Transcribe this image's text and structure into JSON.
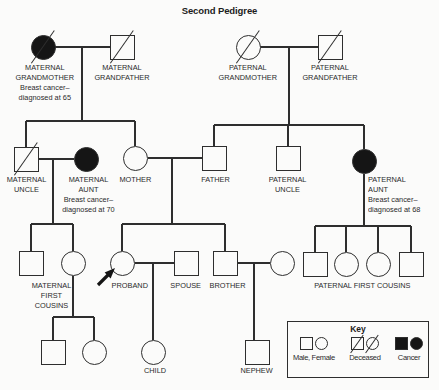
{
  "title": "Second Pedigree",
  "colors": {
    "line": "#2e2e2e",
    "symbol_fill": "#151515",
    "background": "#fbfbfa",
    "text": "#2a2a2a"
  },
  "pedigree": {
    "nodes": [
      {
        "id": "maternal-grandmother",
        "shape": "circle",
        "filled": true,
        "deceased": true,
        "x": 43,
        "y": 47
      },
      {
        "id": "maternal-grandfather",
        "shape": "square",
        "filled": false,
        "deceased": true,
        "x": 122,
        "y": 47
      },
      {
        "id": "paternal-grandmother",
        "shape": "circle",
        "filled": false,
        "deceased": true,
        "x": 248,
        "y": 47
      },
      {
        "id": "paternal-grandfather",
        "shape": "square",
        "filled": false,
        "deceased": true,
        "x": 330,
        "y": 47
      },
      {
        "id": "maternal-uncle",
        "shape": "square",
        "filled": false,
        "deceased": true,
        "x": 26,
        "y": 159
      },
      {
        "id": "maternal-aunt",
        "shape": "circle",
        "filled": true,
        "deceased": false,
        "x": 86,
        "y": 159
      },
      {
        "id": "mother",
        "shape": "circle",
        "filled": false,
        "deceased": false,
        "x": 135,
        "y": 158
      },
      {
        "id": "father",
        "shape": "square",
        "filled": false,
        "deceased": false,
        "x": 214,
        "y": 158
      },
      {
        "id": "paternal-uncle",
        "shape": "square",
        "filled": false,
        "deceased": false,
        "x": 288,
        "y": 158
      },
      {
        "id": "paternal-aunt",
        "shape": "circle",
        "filled": true,
        "deceased": false,
        "x": 364,
        "y": 161
      },
      {
        "id": "maternal-first-cousin-male",
        "shape": "square",
        "filled": false,
        "deceased": false,
        "x": 31,
        "y": 263
      },
      {
        "id": "maternal-first-cousin-female",
        "shape": "circle",
        "filled": false,
        "deceased": false,
        "x": 73,
        "y": 263
      },
      {
        "id": "proband",
        "shape": "circle",
        "filled": false,
        "deceased": false,
        "x": 122,
        "y": 263,
        "proband": true
      },
      {
        "id": "spouse",
        "shape": "square",
        "filled": false,
        "deceased": false,
        "x": 186,
        "y": 263
      },
      {
        "id": "brother",
        "shape": "square",
        "filled": false,
        "deceased": false,
        "x": 225,
        "y": 263
      },
      {
        "id": "brothers-wife",
        "shape": "circle",
        "filled": false,
        "deceased": false,
        "x": 282,
        "y": 263
      },
      {
        "id": "paternal-first-cousin-1",
        "shape": "square",
        "filled": false,
        "deceased": false,
        "x": 315,
        "y": 264
      },
      {
        "id": "paternal-first-cousin-2",
        "shape": "circle",
        "filled": false,
        "deceased": false,
        "x": 346,
        "y": 264
      },
      {
        "id": "paternal-first-cousin-3",
        "shape": "circle",
        "filled": false,
        "deceased": false,
        "x": 378,
        "y": 264
      },
      {
        "id": "paternal-first-cousin-4",
        "shape": "square",
        "filled": false,
        "deceased": false,
        "x": 411,
        "y": 264
      },
      {
        "id": "cousins-child-male",
        "shape": "square",
        "filled": false,
        "deceased": false,
        "x": 53,
        "y": 352
      },
      {
        "id": "cousins-child-female",
        "shape": "circle",
        "filled": false,
        "deceased": false,
        "x": 94,
        "y": 352
      },
      {
        "id": "child",
        "shape": "circle",
        "filled": false,
        "deceased": false,
        "x": 153,
        "y": 352
      },
      {
        "id": "nephew",
        "shape": "square",
        "filled": false,
        "deceased": false,
        "x": 257,
        "y": 352
      }
    ],
    "labels": [
      {
        "id": "maternal-grandmother",
        "x": 45,
        "y": 63,
        "align": "center",
        "lines": [
          "MATERNAL",
          "GRANDMOTHER",
          "Breast cancer–",
          "diagnosed at 65"
        ]
      },
      {
        "id": "maternal-grandfather",
        "x": 122,
        "y": 63,
        "align": "center",
        "lines": [
          "MATERNAL",
          "GRANDFATHER"
        ]
      },
      {
        "id": "paternal-grandmother",
        "x": 248,
        "y": 63,
        "align": "center",
        "lines": [
          "PATERNAL",
          "GRANDMOTHER"
        ]
      },
      {
        "id": "paternal-grandfather",
        "x": 330,
        "y": 63,
        "align": "center",
        "lines": [
          "PATERNAL",
          "GRANDFATHER"
        ]
      },
      {
        "id": "maternal-uncle",
        "x": 26,
        "y": 175,
        "align": "center",
        "lines": [
          "MATERNAL",
          "UNCLE"
        ]
      },
      {
        "id": "maternal-aunt",
        "x": 88,
        "y": 175,
        "align": "center",
        "lines": [
          "MATERNAL",
          "AUNT",
          "Breast cancer–",
          "diagnosed at 70"
        ]
      },
      {
        "id": "mother",
        "x": 135,
        "y": 175,
        "align": "center",
        "lines": [
          "MOTHER"
        ]
      },
      {
        "id": "father",
        "x": 215,
        "y": 175,
        "align": "center",
        "lines": [
          "FATHER"
        ]
      },
      {
        "id": "paternal-uncle",
        "x": 288,
        "y": 175,
        "align": "center",
        "lines": [
          "PATERNAL",
          "UNCLE"
        ]
      },
      {
        "id": "paternal-aunt",
        "x": 368,
        "y": 175,
        "align": "left",
        "lines": [
          "PATERNAL",
          "AUNT",
          "Breast cancer–",
          "diagnosed at 68"
        ]
      },
      {
        "id": "maternal-first-cousins",
        "x": 51,
        "y": 281,
        "align": "center",
        "lines": [
          "MATERNAL",
          "FIRST",
          "COUSINS"
        ]
      },
      {
        "id": "proband",
        "x": 130,
        "y": 281,
        "align": "center",
        "lines": [
          "PROBAND"
        ]
      },
      {
        "id": "spouse",
        "x": 186,
        "y": 281,
        "align": "center",
        "lines": [
          "SPOUSE"
        ]
      },
      {
        "id": "brother",
        "x": 228,
        "y": 281,
        "align": "center",
        "lines": [
          "BROTHER"
        ]
      },
      {
        "id": "paternal-first-cousins",
        "x": 362,
        "y": 281,
        "align": "center",
        "lines": [
          "PATERNAL FIRST COUSINS"
        ]
      },
      {
        "id": "child",
        "x": 155,
        "y": 366,
        "align": "center",
        "lines": [
          "CHILD"
        ]
      },
      {
        "id": "nephew",
        "x": 257,
        "y": 366,
        "align": "center",
        "lines": [
          "NEPHEW"
        ]
      }
    ],
    "connectors": [
      {
        "x1": 55,
        "y1": 47,
        "x2": 110,
        "y2": 47
      },
      {
        "x1": 82,
        "y1": 47,
        "x2": 82,
        "y2": 121
      },
      {
        "x1": 260,
        "y1": 47,
        "x2": 318,
        "y2": 47
      },
      {
        "x1": 289,
        "y1": 47,
        "x2": 289,
        "y2": 125
      },
      {
        "x1": 26,
        "y1": 121,
        "x2": 135,
        "y2": 121
      },
      {
        "x1": 26,
        "y1": 121,
        "x2": 26,
        "y2": 147
      },
      {
        "x1": 135,
        "y1": 121,
        "x2": 135,
        "y2": 146
      },
      {
        "x1": 214,
        "y1": 125,
        "x2": 364,
        "y2": 125
      },
      {
        "x1": 214,
        "y1": 125,
        "x2": 214,
        "y2": 146
      },
      {
        "x1": 288,
        "y1": 125,
        "x2": 288,
        "y2": 146
      },
      {
        "x1": 364,
        "y1": 125,
        "x2": 364,
        "y2": 149
      },
      {
        "x1": 39,
        "y1": 159,
        "x2": 74,
        "y2": 159
      },
      {
        "x1": 53,
        "y1": 159,
        "x2": 53,
        "y2": 224
      },
      {
        "x1": 31,
        "y1": 224,
        "x2": 73,
        "y2": 224
      },
      {
        "x1": 31,
        "y1": 224,
        "x2": 31,
        "y2": 251
      },
      {
        "x1": 73,
        "y1": 224,
        "x2": 73,
        "y2": 251
      },
      {
        "x1": 148,
        "y1": 158,
        "x2": 202,
        "y2": 158
      },
      {
        "x1": 172,
        "y1": 158,
        "x2": 172,
        "y2": 224
      },
      {
        "x1": 122,
        "y1": 224,
        "x2": 225,
        "y2": 224
      },
      {
        "x1": 122,
        "y1": 224,
        "x2": 122,
        "y2": 251
      },
      {
        "x1": 225,
        "y1": 224,
        "x2": 225,
        "y2": 251
      },
      {
        "x1": 364,
        "y1": 174,
        "x2": 364,
        "y2": 226
      },
      {
        "x1": 315,
        "y1": 226,
        "x2": 411,
        "y2": 226
      },
      {
        "x1": 315,
        "y1": 226,
        "x2": 315,
        "y2": 252
      },
      {
        "x1": 346,
        "y1": 226,
        "x2": 346,
        "y2": 252
      },
      {
        "x1": 378,
        "y1": 226,
        "x2": 378,
        "y2": 252
      },
      {
        "x1": 411,
        "y1": 226,
        "x2": 411,
        "y2": 252
      },
      {
        "x1": 135,
        "y1": 263,
        "x2": 174,
        "y2": 263
      },
      {
        "x1": 153,
        "y1": 263,
        "x2": 153,
        "y2": 340
      },
      {
        "x1": 238,
        "y1": 263,
        "x2": 270,
        "y2": 263
      },
      {
        "x1": 254,
        "y1": 263,
        "x2": 254,
        "y2": 340
      },
      {
        "x1": 73,
        "y1": 276,
        "x2": 73,
        "y2": 317
      },
      {
        "x1": 53,
        "y1": 317,
        "x2": 94,
        "y2": 317
      },
      {
        "x1": 53,
        "y1": 317,
        "x2": 53,
        "y2": 340
      },
      {
        "x1": 94,
        "y1": 317,
        "x2": 94,
        "y2": 340
      }
    ]
  },
  "key": {
    "title": "Key",
    "entries": [
      {
        "label": "Male, Female",
        "symbols": [
          "square-open",
          "circle-open"
        ]
      },
      {
        "label": "Deceased",
        "symbols": [
          "square-slashed",
          "circle-slashed"
        ]
      },
      {
        "label": "Cancer",
        "symbols": [
          "square-filled",
          "circle-filled"
        ]
      }
    ]
  }
}
